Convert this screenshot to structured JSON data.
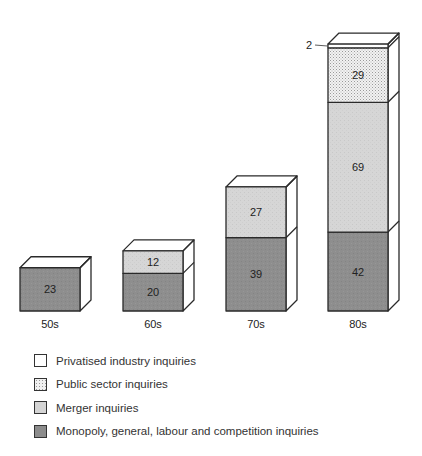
{
  "chart_data": {
    "type": "bar",
    "stacked": true,
    "style": "3d-stacked-boxes",
    "title": "",
    "xlabel": "",
    "ylabel": "",
    "categories": [
      "50s",
      "60s",
      "70s",
      "80s"
    ],
    "series": [
      {
        "name": "Monopoly, general, labour and competition inquiries",
        "values": [
          23,
          20,
          39,
          42
        ],
        "color": "#8c8c8c",
        "pattern": "solid-dark"
      },
      {
        "name": "Merger inquiries",
        "values": [
          0,
          12,
          27,
          69
        ],
        "color": "#d4d4d4",
        "pattern": "light-grey"
      },
      {
        "name": "Public sector inquiries",
        "values": [
          0,
          0,
          0,
          29
        ],
        "color": "#e8e8e8",
        "pattern": "dotted"
      },
      {
        "name": "Privatised industry inquiries",
        "values": [
          0,
          0,
          0,
          2
        ],
        "color": "#ffffff",
        "pattern": "white"
      }
    ],
    "totals": [
      23,
      32,
      66,
      142
    ],
    "annotations": [
      {
        "text": "2",
        "target": "80s Privatised industry inquiries",
        "leader_line": true
      }
    ],
    "legend_position": "bottom-left",
    "grid": false
  },
  "legend": {
    "items": [
      {
        "label": "Privatised industry inquiries",
        "swatch": "white"
      },
      {
        "label": "Public sector inquiries",
        "swatch": "dotted"
      },
      {
        "label": "Merger inquiries",
        "swatch": "light"
      },
      {
        "label": "Monopoly, general, labour and competition inquiries",
        "swatch": "dark"
      }
    ]
  },
  "colors": {
    "monopoly": "#8c8c8c",
    "merger": "#d4d4d4",
    "public": "#e8e8e8",
    "privatised": "#ffffff",
    "outline": "#2a2a2a"
  }
}
